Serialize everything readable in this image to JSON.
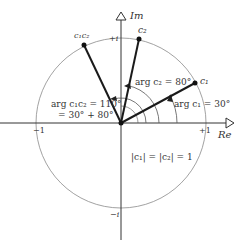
{
  "diagram": {
    "axes": {
      "real_label": "Re",
      "imag_label": "Im",
      "tick_minus_one": "−1",
      "tick_plus_one": "+1",
      "tick_plus_i": "+i",
      "tick_minus_i": "−i"
    },
    "points": [
      {
        "id": "c1",
        "label": "c₁",
        "angle_deg": 30
      },
      {
        "id": "c2",
        "label": "c₂",
        "angle_deg": 80
      },
      {
        "id": "c1c2",
        "label": "c₁c₂",
        "angle_deg": 110
      }
    ],
    "annotations": {
      "arg_c1": "arg c₁ = 30°",
      "arg_c2": "arg c₂ = 80°",
      "arg_c1c2_line1": "arg c₁c₂ = 110°",
      "arg_c1c2_line2": "= 30° + 80°",
      "modulus": "|c₁| = |c₂| = 1"
    },
    "colors": {
      "axis": "#333333",
      "circle": "#888888",
      "vector": "#1a1a1a",
      "text": "#333333"
    }
  }
}
